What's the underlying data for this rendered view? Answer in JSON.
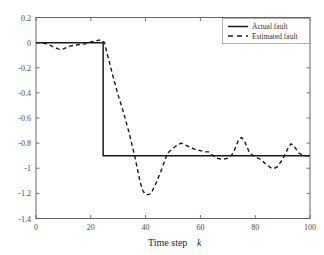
{
  "chart_data": {
    "type": "line",
    "title": "",
    "subtitle": "",
    "xlabel": "Time step k",
    "xlabel_plain": "Time step",
    "xlabel_italic": "k",
    "ylabel": "",
    "xlim": [
      0,
      100
    ],
    "ylim": [
      -1.4,
      0.2
    ],
    "xticks": [
      0,
      20,
      40,
      60,
      80,
      100
    ],
    "xtick_labels": [
      "0",
      "20",
      "40",
      "60",
      "80",
      "100"
    ],
    "yticks": [
      0.2,
      0,
      -0.2,
      -0.4,
      -0.6,
      -0.8,
      -1,
      -1.2,
      -1.4
    ],
    "ytick_labels": [
      "0.2",
      "0",
      "-0.2",
      "-0.4",
      "-0.6",
      "-0.8",
      "-1",
      "-1.2",
      "-1.4"
    ],
    "grid": false,
    "legend_position": "top-right",
    "legend_entries": [
      "Actual fault",
      "Estimated fault"
    ],
    "series": [
      {
        "name": "Actual fault",
        "style": "solid",
        "color": "#1a1a1a",
        "x": [
          0,
          24.5,
          24.5,
          100
        ],
        "values": [
          0,
          0,
          -0.9,
          -0.9
        ]
      },
      {
        "name": "Estimated fault",
        "style": "dashed",
        "color": "#1a1a1a",
        "x": [
          0,
          2,
          4,
          6,
          8,
          9,
          10,
          12,
          14,
          16,
          18,
          20,
          21,
          22,
          23,
          24,
          25,
          26,
          28,
          30,
          32,
          34,
          36,
          38,
          39,
          40,
          41,
          42,
          44,
          46,
          48,
          50,
          52,
          53,
          54,
          56,
          58,
          60,
          62,
          63,
          64,
          66,
          68,
          70,
          72,
          74,
          75,
          76,
          78,
          80,
          82,
          84,
          86,
          87,
          88,
          90,
          92,
          93,
          94,
          96,
          98,
          100
        ],
        "values": [
          0,
          0,
          -0.01,
          -0.03,
          -0.05,
          -0.055,
          -0.05,
          -0.03,
          -0.02,
          -0.015,
          -0.01,
          0.005,
          0.01,
          0.015,
          0.02,
          0.02,
          0.0,
          -0.09,
          -0.26,
          -0.42,
          -0.56,
          -0.72,
          -0.9,
          -1.11,
          -1.18,
          -1.21,
          -1.21,
          -1.2,
          -1.11,
          -1.0,
          -0.88,
          -0.84,
          -0.81,
          -0.8,
          -0.81,
          -0.83,
          -0.85,
          -0.86,
          -0.87,
          -0.87,
          -0.89,
          -0.92,
          -0.93,
          -0.92,
          -0.88,
          -0.77,
          -0.755,
          -0.78,
          -0.88,
          -0.91,
          -0.93,
          -0.97,
          -1.0,
          -1.0,
          -0.99,
          -0.93,
          -0.84,
          -0.805,
          -0.82,
          -0.88,
          -0.9,
          -0.9
        ]
      }
    ]
  },
  "legend": {
    "actual_label": "Actual fault",
    "estimated_label": "Estimated fault"
  }
}
